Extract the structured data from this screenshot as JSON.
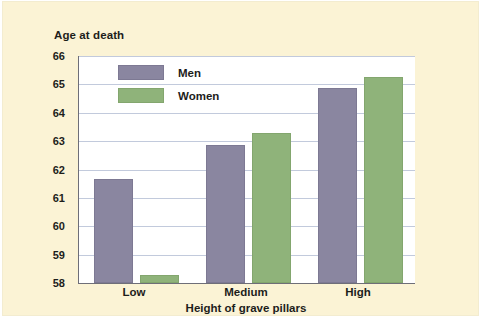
{
  "chart_data": {
    "type": "bar",
    "title": "Age at death",
    "xlabel": "Height of grave pillars",
    "ylabel": "Age at death",
    "categories": [
      "Low",
      "Medium",
      "High"
    ],
    "series": [
      {
        "name": "Men",
        "color": "#8a86a0",
        "values": [
          61.6,
          62.8,
          64.8
        ]
      },
      {
        "name": "Women",
        "color": "#8fb37a",
        "values": [
          58.2,
          63.2,
          65.2
        ]
      }
    ],
    "ylim": [
      58,
      66
    ],
    "yticks": [
      58,
      59,
      60,
      61,
      62,
      63,
      64,
      65,
      66
    ],
    "ytick_labels": [
      "58",
      "59",
      "60",
      "61",
      "62",
      "63",
      "64",
      "65",
      "66"
    ],
    "grid": true,
    "legend_position": "top-left",
    "background_color": "#fbf3d5",
    "plot_background_color": "#ffffff",
    "gridline_color": "#c2cadc",
    "axis_color": "#6e6e78"
  }
}
